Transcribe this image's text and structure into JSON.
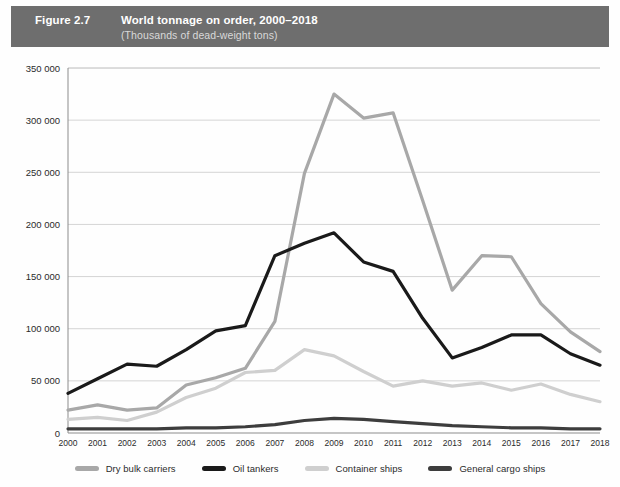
{
  "header": {
    "figure_number": "Figure 2.7",
    "title": "World tonnage on order, 2000–2018",
    "subtitle": "(Thousands of dead-weight tons)",
    "bar_color": "#6e6e6e",
    "title_color": "#ffffff",
    "subtitle_color": "#d9d9d9"
  },
  "chart_data": {
    "type": "line",
    "title": "World tonnage on order, 2000–2018",
    "subtitle": "(Thousands of dead-weight tons)",
    "xlabel": "",
    "ylabel": "",
    "ylim": [
      0,
      350000
    ],
    "ytick_values": [
      0,
      50000,
      100000,
      150000,
      200000,
      250000,
      300000,
      350000
    ],
    "ytick_labels": [
      "0",
      "50 000",
      "100 000",
      "150 000",
      "200 000",
      "250 000",
      "300 000",
      "350 000"
    ],
    "grid": true,
    "grid_axis": "y",
    "legend_position": "bottom",
    "categories": [
      2000,
      2001,
      2002,
      2003,
      2004,
      2005,
      2006,
      2007,
      2008,
      2009,
      2010,
      2011,
      2012,
      2013,
      2014,
      2015,
      2016,
      2017,
      2018
    ],
    "xtick_labels": [
      "2000",
      "2001",
      "2002",
      "2003",
      "2004",
      "2005",
      "2006",
      "2007",
      "2008",
      "2009",
      "2010",
      "2011",
      "2012",
      "2013",
      "2014",
      "2015",
      "2016",
      "2017",
      "2018"
    ],
    "series": [
      {
        "name": "Dry bulk carriers",
        "color": "#a8a8a8",
        "values": [
          22000,
          27000,
          22000,
          24000,
          46000,
          53000,
          62000,
          107000,
          249000,
          325000,
          302000,
          307000,
          223000,
          137000,
          170000,
          169000,
          124000,
          97000,
          78000
        ]
      },
      {
        "name": "Oil tankers",
        "color": "#1a1a1a",
        "values": [
          38000,
          52000,
          66000,
          64000,
          80000,
          98000,
          103000,
          170000,
          182000,
          192000,
          164000,
          155000,
          110000,
          72000,
          82000,
          94000,
          94000,
          76000,
          65000
        ]
      },
      {
        "name": "Container ships",
        "color": "#cfcfcf",
        "values": [
          13000,
          15000,
          12000,
          20000,
          34000,
          43000,
          58000,
          60000,
          80000,
          74000,
          59000,
          45000,
          50000,
          45000,
          48000,
          41000,
          47000,
          37000,
          30000
        ]
      },
      {
        "name": "General cargo ships",
        "color": "#3d3d3d",
        "values": [
          4000,
          4000,
          4000,
          4000,
          5000,
          5000,
          6000,
          8000,
          12000,
          14000,
          13000,
          11000,
          9000,
          7000,
          6000,
          5000,
          5000,
          4000,
          4000
        ]
      }
    ]
  },
  "legend": {
    "items": [
      {
        "label": "Dry bulk carriers",
        "color": "#a8a8a8"
      },
      {
        "label": "Oil tankers",
        "color": "#1a1a1a"
      },
      {
        "label": "Container ships",
        "color": "#cfcfcf"
      },
      {
        "label": "General cargo ships",
        "color": "#3d3d3d"
      }
    ]
  }
}
